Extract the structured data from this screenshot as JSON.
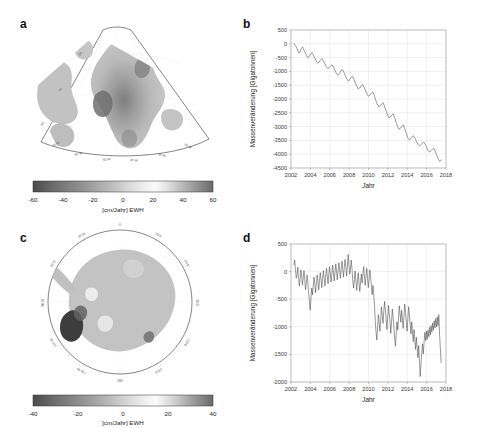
{
  "figure": {
    "panels": {
      "a": "a",
      "b": "b",
      "c": "c",
      "d": "d"
    }
  },
  "colorbars": {
    "greenland": {
      "ticks": [
        "-60",
        "-40",
        "-20",
        "0",
        "20",
        "40",
        "60"
      ],
      "unit": "[cm/Jahr] EWH",
      "min": -60,
      "max": 60
    },
    "antarctica": {
      "ticks": [
        "-40",
        "-20",
        "0",
        "20",
        "40"
      ],
      "unit": "[cm/Jahr] EWH",
      "min": -40,
      "max": 40
    }
  },
  "maps": {
    "greenland": {
      "lat_labels": [
        "80",
        "70",
        "60"
      ],
      "lon_labels": [
        "70 W",
        "60 W",
        "50 W",
        "40 W",
        "30 W",
        "20 W"
      ]
    },
    "antarctica": {
      "lon_labels": [
        "0",
        "30 E",
        "60 E",
        "90 E",
        "120 E",
        "150 E",
        "180",
        "150 W",
        "120 W",
        "90 W",
        "60 W",
        "30 W"
      ]
    }
  },
  "chart_data": [
    {
      "panel": "b",
      "type": "line",
      "title": "",
      "xlabel": "Jahr",
      "ylabel": "Massenveränderung [Gigatonnen]",
      "xlim": [
        2002,
        2018
      ],
      "ylim": [
        -4500,
        500
      ],
      "xticks": [
        2002,
        2004,
        2006,
        2008,
        2010,
        2012,
        2014,
        2016,
        2018
      ],
      "xticklabels": [
        "2002",
        "2004",
        "2006",
        "2008",
        "2010",
        "2012",
        "2014",
        "2016",
        "2018"
      ],
      "yticks": [
        500,
        0,
        -500,
        -1000,
        -1500,
        -2000,
        -2500,
        -3000,
        -3500,
        -4000,
        -4500
      ],
      "yticklabels": [
        "500",
        "0",
        "-500",
        "-1000",
        "-1500",
        "-2000",
        "-2500",
        "-3000",
        "-3500",
        "-4000",
        "-4500"
      ],
      "grid": true,
      "legend": "none",
      "series": [
        {
          "name": "Grönland Massenänderung",
          "x": [
            2002.3,
            2002.45,
            2002.6,
            2002.7,
            2002.8,
            2002.95,
            2003.05,
            2003.2,
            2003.3,
            2003.45,
            2003.6,
            2003.7,
            2003.85,
            2004.0,
            2004.15,
            2004.3,
            2004.45,
            2004.6,
            2004.75,
            2004.9,
            2005.05,
            2005.2,
            2005.35,
            2005.5,
            2005.65,
            2005.8,
            2005.95,
            2006.1,
            2006.25,
            2006.4,
            2006.55,
            2006.7,
            2006.85,
            2007.0,
            2007.15,
            2007.3,
            2007.45,
            2007.6,
            2007.75,
            2007.9,
            2008.05,
            2008.2,
            2008.35,
            2008.5,
            2008.65,
            2008.8,
            2008.95,
            2009.1,
            2009.25,
            2009.4,
            2009.55,
            2009.7,
            2009.85,
            2010.0,
            2010.15,
            2010.3,
            2010.45,
            2010.6,
            2010.75,
            2010.9,
            2011.05,
            2011.2,
            2011.35,
            2011.5,
            2011.65,
            2011.8,
            2011.95,
            2012.1,
            2012.25,
            2012.4,
            2012.55,
            2012.7,
            2012.85,
            2013.0,
            2013.15,
            2013.3,
            2013.45,
            2013.6,
            2013.75,
            2013.9,
            2014.05,
            2014.2,
            2014.35,
            2014.5,
            2014.65,
            2014.8,
            2014.95,
            2015.1,
            2015.25,
            2015.4,
            2015.55,
            2015.7,
            2015.85,
            2016.0,
            2016.15,
            2016.3,
            2016.45,
            2016.6,
            2016.75,
            2016.9,
            2017.05,
            2017.2,
            2017.35,
            2017.5
          ],
          "y": [
            20,
            -60,
            -150,
            -240,
            -330,
            -300,
            -180,
            -120,
            -200,
            -300,
            -420,
            -510,
            -470,
            -390,
            -330,
            -400,
            -520,
            -620,
            -700,
            -660,
            -580,
            -540,
            -620,
            -730,
            -830,
            -900,
            -860,
            -800,
            -760,
            -860,
            -980,
            -1080,
            -1140,
            -1080,
            -980,
            -930,
            -1030,
            -1150,
            -1260,
            -1340,
            -1300,
            -1230,
            -1180,
            -1290,
            -1420,
            -1540,
            -1640,
            -1600,
            -1520,
            -1470,
            -1580,
            -1700,
            -1820,
            -1900,
            -1860,
            -1790,
            -1740,
            -1880,
            -2040,
            -2180,
            -2290,
            -2250,
            -2180,
            -2130,
            -2260,
            -2420,
            -2560,
            -2680,
            -2650,
            -2580,
            -2540,
            -2680,
            -2850,
            -3000,
            -3100,
            -3060,
            -2990,
            -2940,
            -3080,
            -3250,
            -3400,
            -3480,
            -3440,
            -3380,
            -3330,
            -3420,
            -3540,
            -3640,
            -3700,
            -3660,
            -3600,
            -3560,
            -3640,
            -3760,
            -3860,
            -3920,
            -3880,
            -3820,
            -3780,
            -3900,
            -4050,
            -4180,
            -4260,
            -4200,
            -4140,
            -4100
          ]
        }
      ]
    },
    {
      "panel": "d",
      "type": "line",
      "title": "",
      "xlabel": "Jahr",
      "ylabel": "Massenveränderung [Gigatonnen]",
      "xlim": [
        2002,
        2018
      ],
      "ylim": [
        -2000,
        500
      ],
      "xticks": [
        2002,
        2004,
        2006,
        2008,
        2010,
        2012,
        2014,
        2016,
        2018
      ],
      "xticklabels": [
        "2002",
        "2004",
        "2006",
        "2008",
        "2010",
        "2012",
        "2014",
        "2016",
        "2018"
      ],
      "yticks": [
        500,
        0,
        -500,
        -1000,
        -1500,
        -2000
      ],
      "yticklabels": [
        "500",
        "0",
        "-500",
        "-1000",
        "-1500",
        "-2000"
      ],
      "grid": true,
      "legend": "none",
      "series": [
        {
          "name": "Antarktis Massenänderung",
          "x": [
            2002.3,
            2002.38,
            2002.46,
            2002.54,
            2002.62,
            2002.7,
            2002.78,
            2002.86,
            2002.94,
            2003.02,
            2003.1,
            2003.18,
            2003.26,
            2003.34,
            2003.42,
            2003.5,
            2003.58,
            2003.66,
            2003.74,
            2003.82,
            2003.9,
            2003.98,
            2004.06,
            2004.14,
            2004.22,
            2004.3,
            2004.38,
            2004.46,
            2004.54,
            2004.62,
            2004.7,
            2004.78,
            2004.86,
            2004.94,
            2005.02,
            2005.1,
            2005.18,
            2005.26,
            2005.34,
            2005.42,
            2005.5,
            2005.58,
            2005.66,
            2005.74,
            2005.82,
            2005.9,
            2005.98,
            2006.06,
            2006.14,
            2006.22,
            2006.3,
            2006.38,
            2006.46,
            2006.54,
            2006.62,
            2006.7,
            2006.78,
            2006.86,
            2006.94,
            2007.02,
            2007.1,
            2007.18,
            2007.26,
            2007.34,
            2007.42,
            2007.5,
            2007.58,
            2007.66,
            2007.74,
            2007.82,
            2007.9,
            2007.98,
            2008.06,
            2008.14,
            2008.22,
            2008.3,
            2008.38,
            2008.46,
            2008.54,
            2008.62,
            2008.7,
            2008.78,
            2008.86,
            2008.94,
            2009.02,
            2009.1,
            2009.18,
            2009.26,
            2009.34,
            2009.42,
            2009.5,
            2009.58,
            2009.66,
            2009.74,
            2009.82,
            2009.9,
            2009.98,
            2010.06,
            2010.14,
            2010.22,
            2010.3,
            2010.38,
            2010.46,
            2010.54,
            2010.62,
            2010.7,
            2010.78,
            2010.86,
            2010.94,
            2011.02,
            2011.1,
            2011.18,
            2011.26,
            2011.34,
            2011.42,
            2011.5,
            2011.58,
            2011.66,
            2011.74,
            2011.82,
            2011.9,
            2011.98,
            2012.06,
            2012.14,
            2012.22,
            2012.3,
            2012.38,
            2012.46,
            2012.54,
            2012.62,
            2012.7,
            2012.78,
            2012.86,
            2012.94,
            2013.02,
            2013.1,
            2013.18,
            2013.26,
            2013.34,
            2013.42,
            2013.5,
            2013.58,
            2013.66,
            2013.74,
            2013.82,
            2013.9,
            2013.98,
            2014.06,
            2014.14,
            2014.22,
            2014.3,
            2014.38,
            2014.46,
            2014.54,
            2014.62,
            2014.7,
            2014.78,
            2014.86,
            2014.94,
            2015.02,
            2015.1,
            2015.18,
            2015.26,
            2015.34,
            2015.42,
            2015.5,
            2015.58,
            2015.66,
            2015.74,
            2015.82,
            2015.9,
            2015.98,
            2016.06,
            2016.14,
            2016.22,
            2016.3,
            2016.38,
            2016.46,
            2016.54,
            2016.62,
            2016.7,
            2016.78,
            2016.86,
            2016.94,
            2017.02,
            2017.1,
            2017.18,
            2017.26,
            2017.34,
            2017.42,
            2017.5
          ],
          "y": [
            120,
            210,
            40,
            -120,
            -60,
            80,
            -100,
            -260,
            -140,
            30,
            -80,
            -240,
            -120,
            20,
            -150,
            -330,
            -210,
            -60,
            -190,
            -400,
            -520,
            -700,
            -480,
            -300,
            -420,
            -250,
            -100,
            -230,
            -380,
            -220,
            -60,
            -180,
            -330,
            -170,
            -20,
            -140,
            -290,
            -130,
            20,
            -110,
            -260,
            -100,
            60,
            -70,
            -220,
            -60,
            90,
            -40,
            -190,
            -30,
            120,
            -20,
            -170,
            -10,
            140,
            0,
            -150,
            10,
            160,
            30,
            -120,
            40,
            190,
            60,
            -100,
            70,
            220,
            90,
            -80,
            100,
            310,
            130,
            -50,
            60,
            210,
            40,
            -160,
            -300,
            -140,
            10,
            -170,
            -340,
            -180,
            -20,
            -190,
            -360,
            -200,
            -40,
            -210,
            -60,
            90,
            -80,
            -250,
            -90,
            60,
            -120,
            -290,
            -130,
            30,
            -110,
            -280,
            -420,
            -250,
            -400,
            -620,
            -900,
            -1100,
            -1240,
            -1000,
            -780,
            -930,
            -1080,
            -860,
            -640,
            -790,
            -940,
            -720,
            -540,
            -690,
            -840,
            -1050,
            -830,
            -610,
            -760,
            -910,
            -1120,
            -900,
            -680,
            -830,
            -1000,
            -1220,
            -1350,
            -1130,
            -910,
            -1060,
            -840,
            -620,
            -770,
            -920,
            -700,
            -880,
            -1030,
            -810,
            -590,
            -740,
            -900,
            -1080,
            -860,
            -640,
            -790,
            -950,
            -1130,
            -910,
            -1090,
            -1270,
            -1050,
            -1230,
            -1410,
            -1190,
            -1370,
            -1560,
            -1340,
            -1620,
            -1900,
            -1680,
            -1460,
            -1310,
            -1490,
            -1270,
            -1100,
            -1250,
            -1080,
            -1230,
            -1060,
            -1180,
            -1010,
            -1150,
            -980,
            -1100,
            -930,
            -1060,
            -890,
            -1020,
            -850,
            -1000,
            -820,
            -980,
            -780,
            -1150,
            -1400,
            -1650,
            -860
          ]
        }
      ]
    }
  ]
}
